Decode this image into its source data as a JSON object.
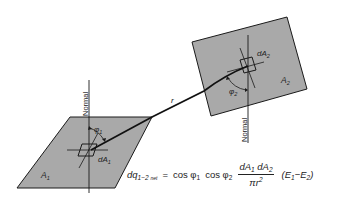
{
  "diagram": {
    "colors": {
      "surface_fill": "#a9a9a9",
      "stroke": "#1a1a1a",
      "background": "#ffffff"
    },
    "surfaces": [
      {
        "id": "A1",
        "label": "A",
        "subscript": "1",
        "element_label": "dA",
        "element_subscript": "1",
        "angle_label": "φ",
        "angle_subscript": "1",
        "normal_label": "Normal"
      },
      {
        "id": "A2",
        "label": "A",
        "subscript": "2",
        "element_label": "dA",
        "element_subscript": "2",
        "angle_label": "φ",
        "angle_subscript": "2",
        "normal_label": "Normal"
      }
    ],
    "distance_label": "r",
    "equation": {
      "lhs": "dq",
      "lhs_sub": "1−2",
      "lhs_sub2": "net",
      "equals": "=",
      "cos1": "cos φ",
      "cos1_sub": "1",
      "cos2": "cos φ",
      "cos2_sub": "2",
      "num_a": "dA",
      "num_a_sub": "1",
      "num_b": "dA",
      "num_b_sub": "2",
      "den": "πr",
      "den_sup": "2",
      "paren_open": "(",
      "e1": "E",
      "e1_sub": "1",
      "minus": "−",
      "e2": "E",
      "e2_sub": "2",
      "paren_close": ")"
    }
  }
}
